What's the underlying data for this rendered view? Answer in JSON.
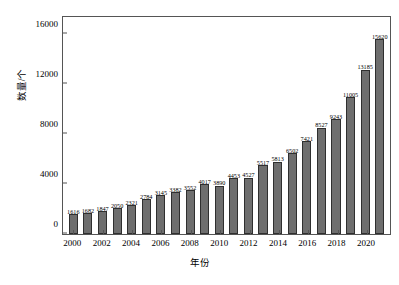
{
  "chart_data": {
    "type": "bar",
    "title": "",
    "xlabel": "年份",
    "ylabel": "数量/个",
    "ylim": [
      0,
      17400
    ],
    "grid": false,
    "legend": null,
    "y_ticks": [
      {
        "value": 0,
        "label": "0"
      },
      {
        "value": 4000,
        "label": "4000"
      },
      {
        "value": 8000,
        "label": "8000"
      },
      {
        "value": 12000,
        "label": "12000"
      },
      {
        "value": 16000,
        "label": "16000"
      }
    ],
    "x_tick_labels": [
      "2000",
      "2002",
      "2004",
      "2006",
      "2008",
      "2010",
      "2012",
      "2014",
      "2016",
      "2018",
      "2020"
    ],
    "categories": [
      "2000",
      "2001",
      "2002",
      "2003",
      "2004",
      "2005",
      "2006",
      "2007",
      "2008",
      "2009",
      "2010",
      "2011",
      "2012",
      "2013",
      "2014",
      "2015",
      "2016",
      "2017",
      "2018",
      "2019",
      "2020",
      "2021"
    ],
    "values": [
      1616,
      1682,
      1847,
      2050,
      2321,
      2784,
      3145,
      3382,
      3552,
      4017,
      3890,
      4453,
      4527,
      5517,
      5813,
      6502,
      7421,
      8527,
      9243,
      11005,
      13185,
      15620
    ],
    "data_labels": [
      "1616",
      "1682",
      "1847",
      "2050",
      "2321",
      "2784",
      "3145",
      "3382",
      "3552",
      "4017",
      "3890",
      "4453",
      "4527",
      "5517",
      "5813",
      "6502",
      "7421",
      "8527",
      "9243",
      "11005",
      "13185",
      "15620"
    ],
    "colors": {
      "bar_fill": "#6e6e6e",
      "bar_border": "#2f2f2f",
      "axis": "#555555",
      "text": "#000000",
      "background": "#ffffff"
    }
  }
}
